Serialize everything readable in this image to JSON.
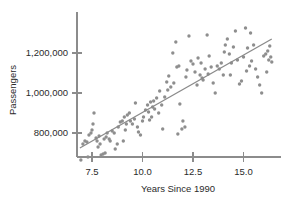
{
  "chart_data": {
    "type": "scatter",
    "title": "",
    "xlabel": "Years Since 1990",
    "ylabel": "Passengers",
    "xlim": [
      6.8,
      16.5
    ],
    "ylim": [
      650000,
      1330000
    ],
    "grid": false,
    "legend": null,
    "xticks": [
      7.5,
      10.0,
      12.5,
      15.0
    ],
    "xtick_labels": [
      "7.5",
      "10.0",
      "12.5",
      "15.0"
    ],
    "yticks": [
      800000,
      1000000,
      1200000
    ],
    "ytick_labels": [
      "800,000",
      "1,000,000",
      "1,200,000"
    ],
    "marker_color": "#8e8e8e",
    "line_color": "#8a8a8a",
    "axis_color": "#8c8c8c",
    "trendline": {
      "label": "least-squares regression line",
      "x": [
        6.9,
        16.4
      ],
      "y": [
        725000,
        1270000
      ]
    },
    "x": [
      6.95,
      7.05,
      7.15,
      7.25,
      7.35,
      7.45,
      7.5,
      7.55,
      7.6,
      7.7,
      7.75,
      7.8,
      7.9,
      7.95,
      8.05,
      8.1,
      8.2,
      8.25,
      8.35,
      8.4,
      8.5,
      8.6,
      8.65,
      8.75,
      8.8,
      8.9,
      9.0,
      9.1,
      9.2,
      9.25,
      9.35,
      9.4,
      9.5,
      9.6,
      9.65,
      9.75,
      9.8,
      9.9,
      10.0,
      10.05,
      10.15,
      10.25,
      10.3,
      10.4,
      10.5,
      10.55,
      10.6,
      10.7,
      10.8,
      10.85,
      10.95,
      11.0,
      11.1,
      11.2,
      11.3,
      11.4,
      11.5,
      11.55,
      11.65,
      11.7,
      11.8,
      11.85,
      11.95,
      12.0,
      12.1,
      12.2,
      12.3,
      12.4,
      12.5,
      12.6,
      12.7,
      12.75,
      12.85,
      12.9,
      13.0,
      13.1,
      13.2,
      13.3,
      13.4,
      13.5,
      13.6,
      13.7,
      13.8,
      13.9,
      14.0,
      14.1,
      14.2,
      14.3,
      14.4,
      14.5,
      14.6,
      14.7,
      14.8,
      14.9,
      15.0,
      15.1,
      15.2,
      15.3,
      15.4,
      15.5,
      15.6,
      15.7,
      15.8,
      15.9,
      16.0,
      16.1,
      16.2,
      16.3,
      16.35,
      16.4,
      7.3,
      8.15,
      9.15,
      10.35,
      11.25,
      12.15,
      13.25,
      14.35,
      15.35,
      16.15,
      7.85,
      9.05,
      10.45,
      11.75,
      12.95,
      14.05,
      15.15,
      16.25
    ],
    "y": [
      665000,
      745000,
      760000,
      755000,
      790000,
      800000,
      815000,
      845000,
      900000,
      775000,
      760000,
      730000,
      745000,
      690000,
      695000,
      770000,
      780000,
      800000,
      770000,
      760000,
      810000,
      800000,
      720000,
      745000,
      830000,
      855000,
      860000,
      880000,
      845000,
      890000,
      900000,
      860000,
      845000,
      870000,
      950000,
      830000,
      805000,
      790000,
      860000,
      880000,
      915000,
      940000,
      905000,
      955000,
      930000,
      960000,
      920000,
      975000,
      900000,
      1010000,
      940000,
      820000,
      980000,
      1055000,
      1085000,
      1030000,
      1200000,
      1050000,
      1255000,
      1130000,
      1135000,
      945000,
      820000,
      860000,
      830000,
      1115000,
      1285000,
      1160000,
      1145000,
      1105000,
      1040000,
      1175000,
      1090000,
      1150000,
      1065000,
      1120000,
      1290000,
      1185000,
      1130000,
      1050000,
      1000000,
      1135000,
      1120000,
      1150000,
      1090000,
      1240000,
      1270000,
      1195000,
      1150000,
      1230000,
      1310000,
      1165000,
      1045000,
      1060000,
      1180000,
      1325000,
      1225000,
      1135000,
      1160000,
      1240000,
      1120000,
      1080000,
      1040000,
      1000000,
      1185000,
      1195000,
      1210000,
      1235000,
      1180000,
      1155000,
      680000,
      700000,
      815000,
      865000,
      1015000,
      1080000,
      1095000,
      1090000,
      1300000,
      1105000,
      785000,
      760000,
      880000,
      795000,
      1075000,
      1205000,
      1110000,
      1165000
    ]
  }
}
